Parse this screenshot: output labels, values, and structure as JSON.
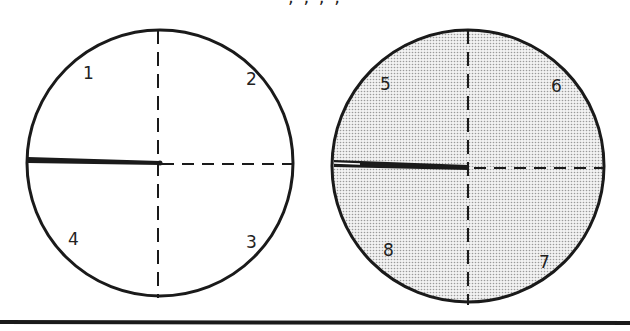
{
  "caption_fragment": "   , , , ,",
  "disks": [
    {
      "id": "left",
      "shaded": false,
      "cx": 160,
      "cy": 163,
      "r": 133,
      "quadrant_labels": [
        "1",
        "2",
        "3",
        "4"
      ]
    },
    {
      "id": "right",
      "shaded": true,
      "cx": 468,
      "cy": 166,
      "r": 136,
      "quadrant_labels": [
        "5",
        "6",
        "7",
        "8"
      ]
    }
  ],
  "colors": {
    "stroke": "#1a1a1a",
    "shade": "#d9d9d9",
    "background": "#ffffff"
  }
}
